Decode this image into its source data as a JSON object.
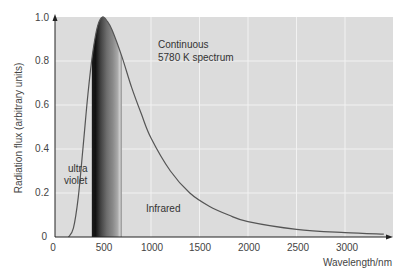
{
  "chart_data": {
    "type": "line",
    "title": "",
    "xlabel": "Wavelength/nm",
    "ylabel": "Radiation flux (arbitrary units)",
    "xlim": [
      0,
      3400
    ],
    "ylim": [
      0,
      1.0
    ],
    "x_ticks": [
      "0",
      "500",
      "1000",
      "1500",
      "2000",
      "2500",
      "3000"
    ],
    "y_ticks": [
      "0",
      "0.2",
      "0.4",
      "0.6",
      "0.8",
      "1.0"
    ],
    "grid": true,
    "series": [
      {
        "name": "Continuous 5780 K spectrum",
        "color": "#555555",
        "x": [
          150,
          200,
          250,
          300,
          350,
          400,
          450,
          500,
          550,
          600,
          700,
          800,
          900,
          1000,
          1200,
          1400,
          1600,
          1800,
          2000,
          2500,
          3000,
          3400
        ],
        "y": [
          0.0,
          0.04,
          0.18,
          0.41,
          0.65,
          0.84,
          0.96,
          1.0,
          0.98,
          0.94,
          0.82,
          0.68,
          0.56,
          0.45,
          0.3,
          0.2,
          0.14,
          0.1,
          0.07,
          0.035,
          0.02,
          0.013
        ]
      }
    ],
    "bands": [
      {
        "name": "visible spectrum",
        "x_start": 390,
        "x_end": 700
      }
    ],
    "annotations": [
      {
        "text": "Continuous",
        "x": 1020,
        "y": 0.87
      },
      {
        "text": "5780 K spectrum",
        "x": 1020,
        "y": 0.81
      },
      {
        "text": "ultra",
        "x": 140,
        "y": 0.41
      },
      {
        "text": "violet",
        "x": 120,
        "y": 0.36
      },
      {
        "text": "Infrared",
        "x": 920,
        "y": 0.13
      }
    ]
  },
  "labels": {
    "xlabel": "Wavelength/nm",
    "ylabel": "Radiation flux (arbitrary units)",
    "anno_continuous": "Continuous",
    "anno_spectrum": "5780 K spectrum",
    "anno_ultra": "ultra",
    "anno_violet": "violet",
    "anno_infrared": "Infrared",
    "y0": "0",
    "y02": "0.2",
    "y04": "0.4",
    "y06": "0.6",
    "y08": "0.8",
    "y10": "1.0",
    "x0": "0",
    "x500": "500",
    "x1000": "1000",
    "x1500": "1500",
    "x2000": "2000",
    "x2500": "2500",
    "x3000": "3000"
  }
}
